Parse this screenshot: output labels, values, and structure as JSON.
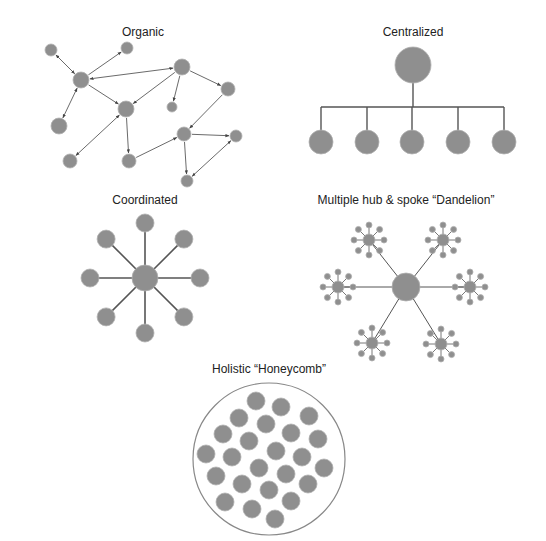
{
  "colors": {
    "node_fill": "#8f8f8f",
    "node_stroke": "#b0b0b0",
    "edge": "#555555",
    "outline": "#888888",
    "background": "#ffffff"
  },
  "diagrams": {
    "organic": {
      "title": "Organic",
      "title_pos": [
        143,
        33
      ],
      "nodes": [
        {
          "id": "a",
          "x": 51,
          "y": 50,
          "r": 6
        },
        {
          "id": "b",
          "x": 127,
          "y": 48,
          "r": 6
        },
        {
          "id": "c",
          "x": 81,
          "y": 80,
          "r": 8
        },
        {
          "id": "d",
          "x": 182,
          "y": 67,
          "r": 8
        },
        {
          "id": "e",
          "x": 126,
          "y": 109,
          "r": 8
        },
        {
          "id": "f",
          "x": 172,
          "y": 107,
          "r": 5
        },
        {
          "id": "g",
          "x": 228,
          "y": 89,
          "r": 7
        },
        {
          "id": "h",
          "x": 59,
          "y": 126,
          "r": 8
        },
        {
          "id": "i",
          "x": 184,
          "y": 134,
          "r": 7
        },
        {
          "id": "j",
          "x": 236,
          "y": 136,
          "r": 6
        },
        {
          "id": "k",
          "x": 70,
          "y": 161,
          "r": 7
        },
        {
          "id": "l",
          "x": 129,
          "y": 161,
          "r": 7
        },
        {
          "id": "m",
          "x": 187,
          "y": 181,
          "r": 6
        }
      ],
      "edges": [
        {
          "from": "a",
          "to": "c",
          "dir": "both"
        },
        {
          "from": "c",
          "to": "b",
          "dir": "to"
        },
        {
          "from": "c",
          "to": "d",
          "dir": "both"
        },
        {
          "from": "c",
          "to": "e",
          "dir": "to"
        },
        {
          "from": "c",
          "to": "h",
          "dir": "both"
        },
        {
          "from": "d",
          "to": "e",
          "dir": "to"
        },
        {
          "from": "d",
          "to": "f",
          "dir": "to"
        },
        {
          "from": "d",
          "to": "g",
          "dir": "to"
        },
        {
          "from": "g",
          "to": "i",
          "dir": "to"
        },
        {
          "from": "e",
          "to": "k",
          "dir": "both"
        },
        {
          "from": "e",
          "to": "l",
          "dir": "to"
        },
        {
          "from": "l",
          "to": "i",
          "dir": "to"
        },
        {
          "from": "i",
          "to": "j",
          "dir": "to"
        },
        {
          "from": "i",
          "to": "m",
          "dir": "to"
        },
        {
          "from": "m",
          "to": "j",
          "dir": "both"
        }
      ]
    },
    "centralized": {
      "title": "Centralized",
      "title_pos": [
        413,
        33
      ],
      "root": {
        "x": 413,
        "y": 65,
        "r": 18
      },
      "bar_y": 107,
      "children_y": 142,
      "child_r": 12,
      "children_x": [
        321,
        367,
        412,
        458,
        504
      ]
    },
    "coordinated": {
      "title": "Coordinated",
      "title_pos": [
        145,
        201
      ],
      "center": {
        "x": 145,
        "y": 278,
        "r": 13
      },
      "spoke_length": 55,
      "spoke_count": 8,
      "leaf_r": 9
    },
    "dandelion": {
      "title": "Multiple hub & spoke “Dandelion”",
      "title_pos": [
        406,
        201
      ],
      "center": {
        "x": 406,
        "y": 287,
        "r": 14
      },
      "hubs": [
        {
          "x": 369,
          "y": 240
        },
        {
          "x": 443,
          "y": 240
        },
        {
          "x": 338,
          "y": 287
        },
        {
          "x": 470,
          "y": 287
        },
        {
          "x": 372,
          "y": 343
        },
        {
          "x": 441,
          "y": 344
        }
      ],
      "hub_r": 6,
      "petal_count": 8,
      "petal_len": 15,
      "petal_r": 3
    },
    "honeycomb": {
      "title": "Holistic “Honeycomb”",
      "title_pos": [
        269,
        370
      ],
      "outline": {
        "x": 269,
        "y": 459,
        "r": 76
      },
      "cell_r": 9,
      "cells": [
        [
          256,
          401
        ],
        [
          281,
          407
        ],
        [
          309,
          416
        ],
        [
          239,
          418
        ],
        [
          266,
          424
        ],
        [
          291,
          433
        ],
        [
          223,
          434
        ],
        [
          249,
          441
        ],
        [
          318,
          439
        ],
        [
          206,
          454
        ],
        [
          232,
          457
        ],
        [
          276,
          451
        ],
        [
          302,
          457
        ],
        [
          216,
          476
        ],
        [
          259,
          468
        ],
        [
          286,
          474
        ],
        [
          324,
          468
        ],
        [
          242,
          484
        ],
        [
          269,
          490
        ],
        [
          308,
          484
        ],
        [
          225,
          502
        ],
        [
          252,
          509
        ],
        [
          291,
          501
        ],
        [
          275,
          519
        ]
      ]
    }
  }
}
